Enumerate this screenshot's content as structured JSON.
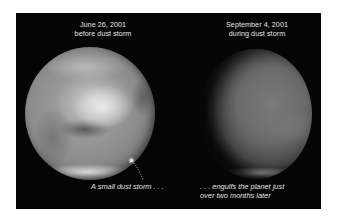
{
  "figure": {
    "left_panel": {
      "date": "June 26, 2001",
      "subtitle": "before dust storm",
      "caption": "A small dust storm . . ."
    },
    "right_panel": {
      "date": "September 4, 2001",
      "subtitle": "during dust storm",
      "caption_line1": ". . . engulfs the planet just",
      "caption_line2": "over two months later"
    },
    "colors": {
      "background": "#050505",
      "text": "#e6e6e6",
      "page": "#ffffff"
    }
  }
}
